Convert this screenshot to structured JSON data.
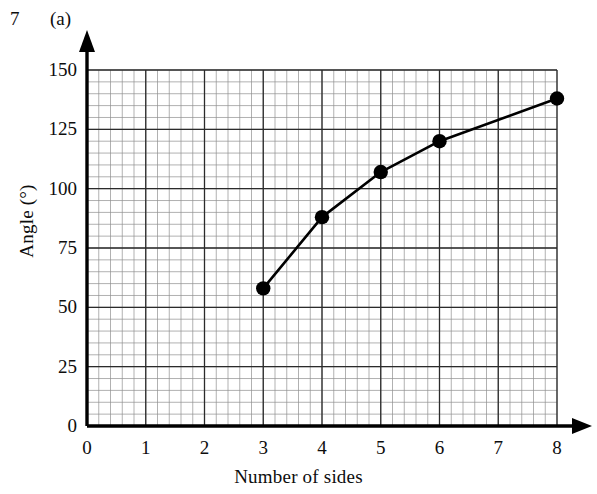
{
  "header": {
    "question_number": "7",
    "part_label": "(a)"
  },
  "chart_data": {
    "type": "line",
    "title": "",
    "xlabel": "Number of sides",
    "ylabel": "Angle (°)",
    "xlim": [
      0,
      8
    ],
    "ylim": [
      0,
      150
    ],
    "xticks": [
      "0",
      "1",
      "2",
      "3",
      "4",
      "5",
      "6",
      "7",
      "8"
    ],
    "xtick_values": [
      0,
      1,
      2,
      3,
      4,
      5,
      6,
      7,
      8
    ],
    "yticks": [
      "0",
      "25",
      "50",
      "75",
      "100",
      "125",
      "150"
    ],
    "ytick_values": [
      0,
      25,
      50,
      75,
      100,
      125,
      150
    ],
    "grid": true,
    "grid_minor_step_x": 0.2,
    "grid_minor_step_y": 5,
    "grid_major_step_x": 1,
    "grid_major_step_y": 25,
    "legend": "none",
    "x": [
      3,
      4,
      5,
      6,
      8
    ],
    "y": [
      58,
      88,
      107,
      120,
      138
    ],
    "series": [
      {
        "name": "Interior angle",
        "x": [
          3,
          4,
          5,
          6,
          8
        ],
        "values": [
          58,
          88,
          107,
          120,
          138
        ],
        "marker": "filled-circle",
        "line_style": "solid",
        "color": "#000000"
      }
    ],
    "point_labels": [
      "(3, 58)",
      "(4, 88)",
      "(5, 107)",
      "(6, 120)",
      "(8, 138)"
    ]
  },
  "colors": {
    "axis": "#000000",
    "grid_major": "#2b2b2b",
    "grid_minor": "#8f8f8f",
    "data": "#000000",
    "background": "#ffffff"
  }
}
